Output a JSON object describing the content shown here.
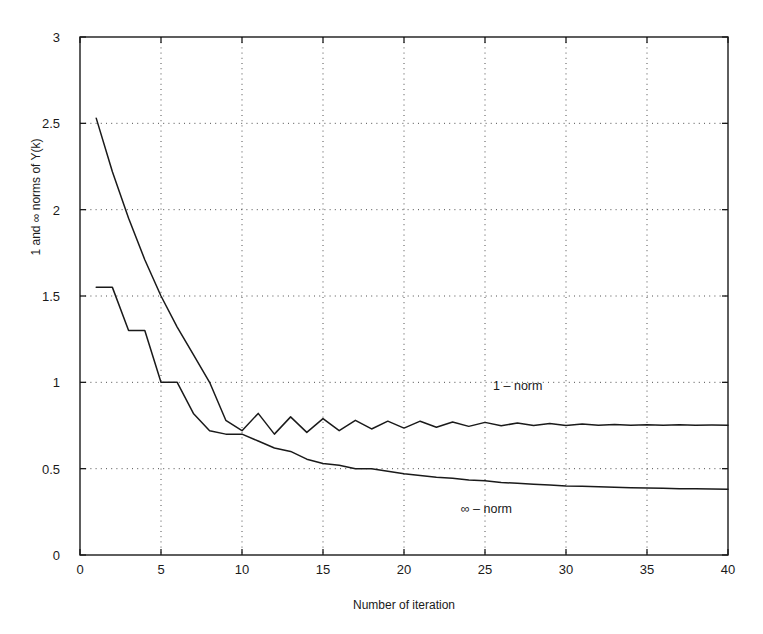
{
  "chart_data": {
    "type": "line",
    "title": "",
    "xlabel": "Number of iteration",
    "ylabel": "1 and ∞ norms of Y(k)",
    "xlim": [
      0,
      40
    ],
    "ylim": [
      0,
      3
    ],
    "xticks": [
      0,
      5,
      10,
      15,
      20,
      25,
      30,
      35,
      40
    ],
    "yticks": [
      0,
      0.5,
      1,
      1.5,
      2,
      2.5,
      3
    ],
    "xtick_labels": [
      "0",
      "5",
      "10",
      "15",
      "20",
      "25",
      "30",
      "35",
      "40"
    ],
    "ytick_labels": [
      "0",
      "0.5",
      "1",
      "1.5",
      "2",
      "2.5",
      "3"
    ],
    "grid": true,
    "grid_style": "dotted",
    "legend": "none",
    "line_color": "#1a1a1a",
    "series": [
      {
        "name": "1 - norm",
        "annotation": "1 – norm",
        "annotation_x": 25.5,
        "annotation_y": 0.97,
        "x": [
          1,
          2,
          3,
          4,
          5,
          6,
          7,
          8,
          9,
          10,
          11,
          12,
          13,
          14,
          15,
          16,
          17,
          18,
          19,
          20,
          21,
          22,
          23,
          24,
          25,
          26,
          27,
          28,
          29,
          30,
          31,
          32,
          33,
          34,
          35,
          36,
          37,
          38,
          39,
          40
        ],
        "values": [
          2.53,
          2.22,
          1.95,
          1.71,
          1.5,
          1.32,
          1.16,
          1.0,
          0.78,
          0.72,
          0.82,
          0.7,
          0.8,
          0.71,
          0.79,
          0.72,
          0.78,
          0.73,
          0.775,
          0.735,
          0.775,
          0.74,
          0.77,
          0.745,
          0.768,
          0.748,
          0.765,
          0.75,
          0.762,
          0.75,
          0.758,
          0.751,
          0.756,
          0.752,
          0.755,
          0.752,
          0.754,
          0.752,
          0.753,
          0.752
        ]
      },
      {
        "name": "infinity - norm",
        "annotation": "∞ – norm",
        "annotation_x": 23.5,
        "annotation_y": 0.255,
        "x": [
          1,
          2,
          3,
          4,
          5,
          6,
          7,
          8,
          9,
          10,
          11,
          12,
          13,
          14,
          15,
          16,
          17,
          18,
          19,
          20,
          21,
          22,
          23,
          24,
          25,
          26,
          27,
          28,
          29,
          30,
          31,
          32,
          33,
          34,
          35,
          36,
          37,
          38,
          39,
          40
        ],
        "values": [
          1.55,
          1.55,
          1.3,
          1.3,
          1.0,
          1.0,
          0.82,
          0.72,
          0.7,
          0.7,
          0.66,
          0.62,
          0.6,
          0.555,
          0.53,
          0.52,
          0.5,
          0.5,
          0.485,
          0.47,
          0.46,
          0.45,
          0.445,
          0.435,
          0.43,
          0.42,
          0.415,
          0.41,
          0.405,
          0.4,
          0.398,
          0.395,
          0.392,
          0.39,
          0.388,
          0.386,
          0.384,
          0.383,
          0.382,
          0.381
        ]
      }
    ]
  },
  "axes": {
    "x_label": "Number of iteration",
    "y_label": "1 and ∞ norms of Y(k)"
  },
  "annotations": {
    "one_norm": "1 – norm",
    "inf_norm": "∞ – norm"
  }
}
